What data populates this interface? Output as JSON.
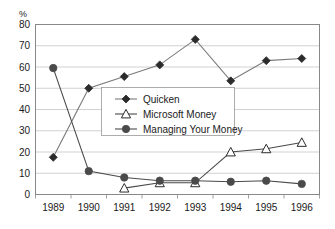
{
  "chart_data": {
    "type": "line",
    "title": "",
    "xlabel": "",
    "ylabel": "%",
    "ylim": [
      0,
      80
    ],
    "ytick_step": 10,
    "yticks": [
      "0",
      "10",
      "20",
      "30",
      "40",
      "50",
      "60",
      "70",
      "80"
    ],
    "grid": true,
    "legend_position": "center",
    "categories": [
      "1989",
      "1990",
      "1991",
      "1992",
      "1993",
      "1994",
      "1995",
      "1996"
    ],
    "series": [
      {
        "name": "Quicken",
        "marker": "filled-diamond",
        "color": "#2b2b2b",
        "line_color": "#7a7a7a",
        "values": [
          17.5,
          50,
          55.5,
          61,
          73,
          53.5,
          63,
          64
        ]
      },
      {
        "name": "Microsoft Money",
        "marker": "open-triangle",
        "color": "#2b2b2b",
        "line_color": "#4a4a4a",
        "values": [
          null,
          null,
          3,
          5.5,
          5.5,
          20,
          21.5,
          24.5
        ]
      },
      {
        "name": "Managing Your Money",
        "marker": "filled-circle",
        "color": "#4a4a4a",
        "line_color": "#4a4a4a",
        "values": [
          59.5,
          11,
          8,
          6.5,
          6.5,
          6,
          6.5,
          5
        ]
      }
    ]
  },
  "axis": {
    "unit_label": "%"
  },
  "legend": {
    "entries": [
      {
        "label": "Quicken"
      },
      {
        "label": "Microsoft Money"
      },
      {
        "label": "Managing Your Money"
      }
    ]
  }
}
